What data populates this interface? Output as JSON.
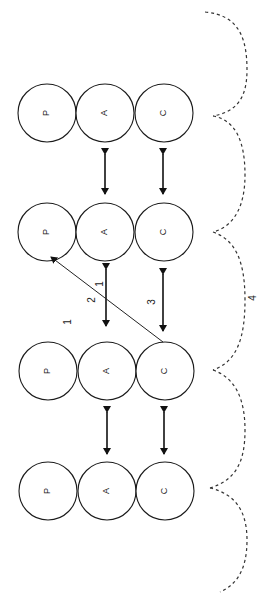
{
  "diagram": {
    "groups": [
      {
        "id": "group-1",
        "cy": 113,
        "nodes": [
          {
            "label": "P",
            "cx": 47
          },
          {
            "label": "A",
            "cx": 105
          },
          {
            "label": "C",
            "cx": 164
          }
        ]
      },
      {
        "id": "group-2",
        "cy": 232,
        "nodes": [
          {
            "label": "P",
            "cx": 47
          },
          {
            "label": "A",
            "cx": 105
          },
          {
            "label": "C",
            "cx": 164
          }
        ]
      },
      {
        "id": "group-3",
        "cy": 371,
        "nodes": [
          {
            "label": "P",
            "cx": 48
          },
          {
            "label": "A",
            "cx": 107
          },
          {
            "label": "C",
            "cx": 165
          }
        ]
      },
      {
        "id": "group-4",
        "cy": 491,
        "nodes": [
          {
            "label": "P",
            "cx": 48
          },
          {
            "label": "A",
            "cx": 107
          },
          {
            "label": "C",
            "cx": 165
          }
        ]
      }
    ],
    "node_radius": 29,
    "edge_labels": [
      {
        "text": "1",
        "x": 68,
        "y": 322
      },
      {
        "text": "2",
        "x": 92,
        "y": 300
      },
      {
        "text": "1",
        "x": 100,
        "y": 284
      },
      {
        "text": "3",
        "x": 152,
        "y": 302
      },
      {
        "text": "4",
        "x": 253,
        "y": 298
      }
    ],
    "colors": {
      "background": "#ffffff",
      "stroke": "#1a1a1a",
      "dashed": "#333333"
    }
  }
}
